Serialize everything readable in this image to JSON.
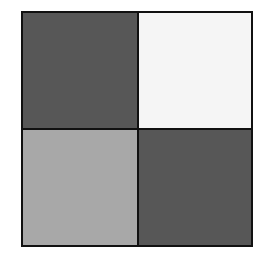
{
  "diagram": {
    "type": "2x2 grid",
    "border_color": "#111111",
    "cells": [
      {
        "position": "top-left",
        "color": "#575757",
        "label": ""
      },
      {
        "position": "top-right",
        "color": "#f5f5f5",
        "label": ""
      },
      {
        "position": "bottom-left",
        "color": "#a8a8a8",
        "label": ""
      },
      {
        "position": "bottom-right",
        "color": "#575757",
        "label": ""
      }
    ]
  }
}
